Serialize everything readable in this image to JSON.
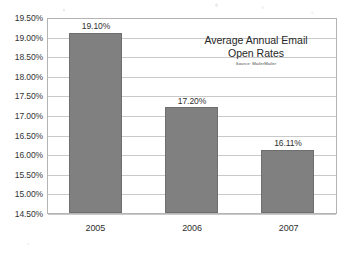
{
  "chart_data": {
    "type": "bar",
    "title": "Average Annual Email Open Rates",
    "title_lines": [
      "Average Annual Email",
      "Open Rates"
    ],
    "source_note": "Source: MailerMailer",
    "xlabel": "",
    "ylabel": "",
    "categories": [
      "2005",
      "2006",
      "2007"
    ],
    "values": [
      19.1,
      17.2,
      16.11
    ],
    "value_labels": [
      "19.10%",
      "17.20%",
      "16.11%"
    ],
    "ylim": [
      14.5,
      19.5
    ],
    "ytick_step": 0.5,
    "ytick_labels": [
      "19.50%",
      "19.00%",
      "18.50%",
      "18.00%",
      "17.50%",
      "17.00%",
      "16.50%",
      "16.00%",
      "15.50%",
      "15.00%",
      "14.50%"
    ],
    "ytick_values": [
      19.5,
      19.0,
      18.5,
      18.0,
      17.5,
      17.0,
      16.5,
      16.0,
      15.5,
      15.0,
      14.5
    ],
    "grid": true,
    "grid_orientation": "horizontal",
    "legend": false,
    "legend_position": "none",
    "bar_color": "#808080",
    "bar_edge_color": "#6e6e6e",
    "grid_color": "#c9c9c9",
    "axis_color": "#b4b4b4",
    "background_color": "#ffffff",
    "text_color": "#2f2f2f"
  }
}
